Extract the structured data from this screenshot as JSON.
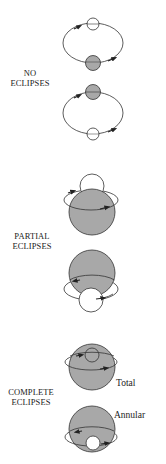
{
  "colors": {
    "background": "#ffffff",
    "star_fill": "#a8a8a8",
    "stroke": "#333333",
    "companion_fill": "#ffffff"
  },
  "sections": [
    {
      "id": "no-eclipses",
      "label_lines": [
        "NO",
        "ECLIPSES"
      ],
      "configurations": [
        {
          "description": "orbit with white companion at top and grey star at bottom",
          "orbit": {
            "cx": 93,
            "cy": 43,
            "rx": 30,
            "ry": 20
          },
          "star": {
            "cx": 93,
            "cy": 63,
            "r": 7.5
          },
          "companion": {
            "cx": 93,
            "cy": 24,
            "r": 6
          }
        },
        {
          "description": "orbit with grey star at top and white companion at bottom",
          "orbit": {
            "cx": 93,
            "cy": 113,
            "rx": 30,
            "ry": 21
          },
          "star": {
            "cx": 93,
            "cy": 92,
            "r": 7.5
          },
          "companion": {
            "cx": 93,
            "cy": 134,
            "r": 6
          }
        }
      ]
    },
    {
      "id": "partial-eclipses",
      "label_lines": [
        "PARTIAL",
        "ECLIPSES"
      ],
      "configurations": [
        {
          "description": "companion partly behind top of star",
          "orbit": {
            "cx": 91,
            "cy": 200,
            "rx": 27,
            "ry": 10
          },
          "star": {
            "cx": 92,
            "cy": 212,
            "r": 23
          },
          "companion": {
            "cx": 92,
            "cy": 186,
            "r": 12
          }
        },
        {
          "description": "companion partly in front of bottom of star",
          "orbit": {
            "cx": 91,
            "cy": 289,
            "rx": 27,
            "ry": 11
          },
          "star": {
            "cx": 92,
            "cy": 273,
            "r": 23
          },
          "companion": {
            "cx": 91,
            "cy": 300,
            "r": 12
          }
        }
      ]
    },
    {
      "id": "complete-eclipses",
      "label_lines": [
        "COMPLETE",
        "ECLIPSES"
      ],
      "configurations": [
        {
          "description": "Total",
          "sublabel": "Total",
          "orbit": {
            "cx": 91,
            "cy": 362,
            "rx": 26,
            "ry": 8
          },
          "star": {
            "cx": 92,
            "cy": 367,
            "r": 23
          },
          "companion": {
            "cx": 92,
            "cy": 355,
            "r": 7
          }
        },
        {
          "description": "Annular",
          "sublabel": "Annular",
          "orbit": {
            "cx": 91,
            "cy": 437,
            "rx": 26,
            "ry": 9
          },
          "star": {
            "cx": 92,
            "cy": 429,
            "r": 23
          },
          "companion": {
            "cx": 93,
            "cy": 443,
            "r": 7
          }
        }
      ]
    }
  ]
}
